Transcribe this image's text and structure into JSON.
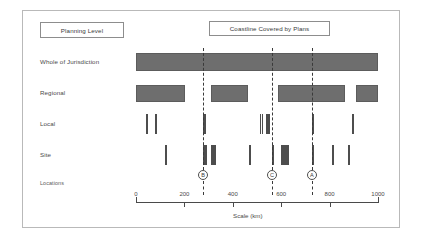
{
  "headers": {
    "planning_level": "Planning Level",
    "coastline": "Coastline Covered by Plans"
  },
  "axis_caption": "Scale (km)",
  "chart_data": {
    "type": "bar",
    "title": "Coastline Covered by Plans",
    "xlabel": "Scale (km)",
    "ylabel": "Planning Level",
    "xlim": [
      0,
      1000
    ],
    "grid": false,
    "legend": "none",
    "xticks": [
      0,
      200,
      400,
      600,
      800,
      1000
    ],
    "xticklabels": [
      "0",
      "200",
      "400",
      "600",
      "800",
      "1000"
    ],
    "categories": [
      "Whole of Jurisdiction",
      "Regional",
      "Local",
      "Site",
      "Locations"
    ],
    "series": [
      {
        "name": "Whole of Jurisdiction",
        "kind": "span",
        "spans": [
          [
            0,
            1000
          ]
        ]
      },
      {
        "name": "Regional",
        "kind": "span",
        "spans": [
          [
            0,
            203
          ],
          [
            310,
            463
          ],
          [
            587,
            863
          ],
          [
            910,
            1000
          ]
        ]
      },
      {
        "name": "Local",
        "kind": "ticks",
        "ticks": [
          42,
          79,
          277,
          279,
          281,
          512,
          520,
          537,
          543,
          549,
          727,
          893
        ]
      },
      {
        "name": "Site",
        "kind": "ticks",
        "ticks": [
          120,
          277,
          285,
          310,
          318,
          326,
          467,
          562,
          600,
          608,
          616,
          624,
          727,
          810,
          876
        ]
      }
    ],
    "locations": [
      {
        "label": "B",
        "value": 277
      },
      {
        "label": "C",
        "value": 562
      },
      {
        "label": "A",
        "value": 727
      }
    ],
    "annotations": [
      "Dashed vertical lines mark locations A, B and C across all planning levels"
    ]
  },
  "colors": {
    "bar_fill": "#6e6e6e",
    "bar_stroke": "#5c5c5c",
    "tick": "#4d4d4d",
    "axis": "#4a4a4a",
    "frame": "#b9b9b9",
    "text": "#4a4a4a",
    "background": "#ffffff"
  }
}
